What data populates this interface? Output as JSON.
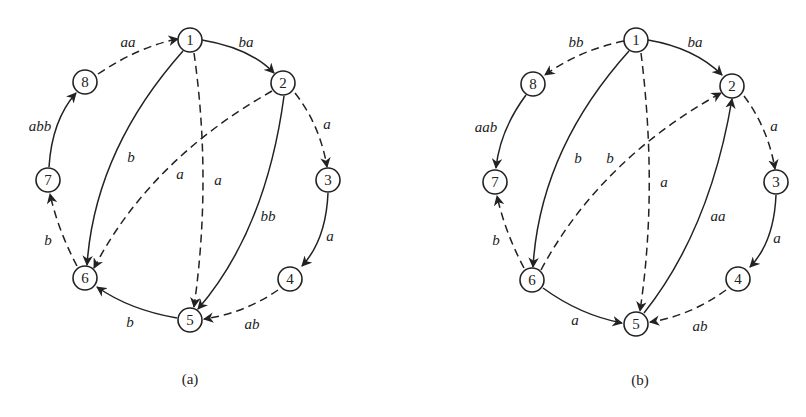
{
  "figures": [
    {
      "id": "a",
      "caption": "(a)",
      "nodes": [
        {
          "id": "1",
          "label": "1",
          "x": 190,
          "y": 40
        },
        {
          "id": "2",
          "label": "2",
          "x": 283,
          "y": 83
        },
        {
          "id": "3",
          "label": "3",
          "x": 328,
          "y": 180
        },
        {
          "id": "4",
          "label": "4",
          "x": 290,
          "y": 279
        },
        {
          "id": "5",
          "label": "5",
          "x": 190,
          "y": 320
        },
        {
          "id": "6",
          "label": "6",
          "x": 85,
          "y": 278
        },
        {
          "id": "7",
          "label": "7",
          "x": 48,
          "y": 180
        },
        {
          "id": "8",
          "label": "8",
          "x": 85,
          "y": 82
        }
      ],
      "edges": [
        {
          "from": "8",
          "to": "1",
          "label": "aa",
          "style": "dashed"
        },
        {
          "from": "1",
          "to": "2",
          "label": "ba",
          "style": "solid"
        },
        {
          "from": "2",
          "to": "3",
          "label": "a",
          "style": "dashed"
        },
        {
          "from": "3",
          "to": "4",
          "label": "a",
          "style": "solid"
        },
        {
          "from": "4",
          "to": "5",
          "label": "ab",
          "style": "dashed"
        },
        {
          "from": "5",
          "to": "6",
          "label": "b",
          "style": "solid"
        },
        {
          "from": "6",
          "to": "7",
          "label": "b",
          "style": "dashed"
        },
        {
          "from": "7",
          "to": "8",
          "label": "abb",
          "style": "solid"
        },
        {
          "from": "1",
          "to": "6",
          "label": "b",
          "style": "solid"
        },
        {
          "from": "1",
          "to": "5",
          "label": "a",
          "style": "dashed"
        },
        {
          "from": "2",
          "to": "6",
          "label": "a",
          "style": "dashed"
        },
        {
          "from": "2",
          "to": "5",
          "label": "bb",
          "style": "solid"
        }
      ]
    },
    {
      "id": "b",
      "caption": "(b)",
      "nodes": [
        {
          "id": "1",
          "label": "1",
          "x": 636,
          "y": 40
        },
        {
          "id": "2",
          "label": "2",
          "x": 732,
          "y": 86
        },
        {
          "id": "3",
          "label": "3",
          "x": 776,
          "y": 182
        },
        {
          "id": "4",
          "label": "4",
          "x": 738,
          "y": 279
        },
        {
          "id": "5",
          "label": "5",
          "x": 636,
          "y": 324
        },
        {
          "id": "6",
          "label": "6",
          "x": 532,
          "y": 280
        },
        {
          "id": "7",
          "label": "7",
          "x": 495,
          "y": 182
        },
        {
          "id": "8",
          "label": "8",
          "x": 533,
          "y": 84
        }
      ],
      "edges": [
        {
          "from": "1",
          "to": "8",
          "label": "bb",
          "style": "dashed"
        },
        {
          "from": "1",
          "to": "2",
          "label": "ba",
          "style": "solid"
        },
        {
          "from": "2",
          "to": "3",
          "label": "a",
          "style": "dashed"
        },
        {
          "from": "3",
          "to": "4",
          "label": "a",
          "style": "solid"
        },
        {
          "from": "4",
          "to": "5",
          "label": "ab",
          "style": "dashed"
        },
        {
          "from": "6",
          "to": "5",
          "label": "a",
          "style": "solid"
        },
        {
          "from": "6",
          "to": "7",
          "label": "b",
          "style": "dashed"
        },
        {
          "from": "8",
          "to": "7",
          "label": "aab",
          "style": "solid"
        },
        {
          "from": "1",
          "to": "6",
          "label": "b",
          "style": "solid"
        },
        {
          "from": "1",
          "to": "5",
          "label": "a",
          "style": "dashed"
        },
        {
          "from": "6",
          "to": "2",
          "label": "b",
          "style": "dashed"
        },
        {
          "from": "5",
          "to": "2",
          "label": "aa",
          "style": "solid"
        }
      ]
    }
  ]
}
